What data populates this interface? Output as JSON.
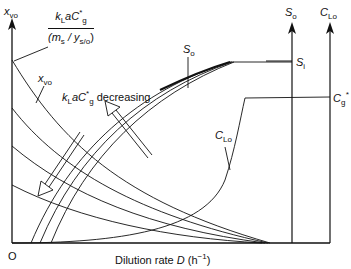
{
  "diagram": {
    "x_axis": {
      "origin_label": "O",
      "label_prefix": "Dilution rate ",
      "label_var": "D",
      "label_unit_open": " (h",
      "label_unit_exp": "−1",
      "label_unit_close": ")"
    },
    "left_axis": {
      "var": "x",
      "sub": "vo"
    },
    "right_axis_1": {
      "var": "S",
      "sub": "o"
    },
    "right_axis_2": {
      "var": "C",
      "sub": "Lo"
    },
    "intercept_label": {
      "num_k": "k",
      "num_k_sub": "L",
      "num_rest": "aC",
      "num_sup": "*",
      "num_sub": "g",
      "den_open": "(m",
      "den_m_sub": "s",
      "den_mid": " / y",
      "den_y_sub": "s/o",
      "den_close": ")"
    },
    "curve_labels": {
      "xvo": {
        "var": "x",
        "sub": "vo"
      },
      "So": {
        "var": "S",
        "sub": "o"
      },
      "Si": {
        "var": "S",
        "sub": "i"
      },
      "Cg": {
        "var": "C",
        "sub": "g",
        "sup": "*"
      },
      "CLo": {
        "var": "C",
        "sub": "Lo"
      }
    },
    "annotation": {
      "k": "k",
      "k_sub": "L",
      "rest": "aC",
      "sup": "*",
      "sub": "g",
      "text": " decreasing"
    }
  }
}
